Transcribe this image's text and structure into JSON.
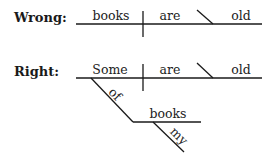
{
  "wrong": {
    "label": "Wrong:",
    "subject": "books",
    "verb": "are",
    "complement": "old"
  },
  "right": {
    "label": "Right:",
    "subject": "Some",
    "verb": "are",
    "complement": "old",
    "preposition": "of",
    "object": "books",
    "modifier": "my"
  }
}
